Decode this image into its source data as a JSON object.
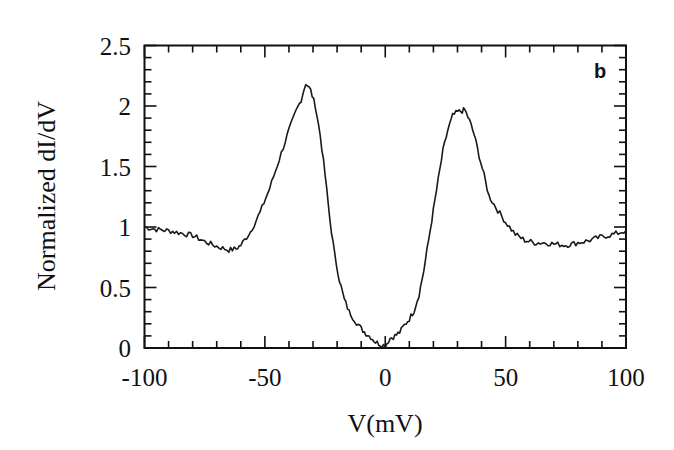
{
  "chart_data": {
    "type": "line",
    "title": "",
    "panel_label": "b",
    "xlabel": "V(mV)",
    "ylabel": "Normalized dI/dV",
    "xlim": [
      -100,
      100
    ],
    "ylim": [
      0,
      2.5
    ],
    "x_ticks": [
      -100,
      -50,
      0,
      50,
      100
    ],
    "x_tick_labels": [
      "-100",
      "-50",
      "0",
      "50",
      "100"
    ],
    "x_minor_step": 10,
    "y_ticks": [
      0,
      0.5,
      1,
      1.5,
      2,
      2.5
    ],
    "y_tick_labels": [
      "0",
      "0.5",
      "1",
      "1.5",
      "2",
      "2.5"
    ],
    "y_minor_step": 0.1,
    "grid": false,
    "legend": null,
    "line_color": "#1a1a1a",
    "series": [
      {
        "name": "dI/dV",
        "x": [
          -100,
          -95,
          -90,
          -85,
          -80,
          -75,
          -70,
          -65,
          -62,
          -60,
          -56,
          -52,
          -48,
          -44,
          -40,
          -37,
          -35,
          -33,
          -31,
          -29,
          -27,
          -25,
          -23,
          -21,
          -19,
          -17,
          -15,
          -12,
          -10,
          -8,
          -6,
          -4,
          -2,
          0,
          2,
          4,
          6,
          8,
          10,
          12,
          14,
          16,
          18,
          20,
          22,
          24,
          26,
          28,
          30,
          32,
          33,
          35,
          37,
          39,
          41,
          43,
          46,
          50,
          54,
          58,
          62,
          66,
          70,
          75,
          80,
          85,
          90,
          95,
          100
        ],
        "y": [
          1.0,
          0.98,
          0.97,
          0.95,
          0.93,
          0.88,
          0.84,
          0.81,
          0.82,
          0.85,
          0.96,
          1.12,
          1.32,
          1.56,
          1.8,
          1.96,
          2.05,
          2.19,
          2.13,
          2.0,
          1.76,
          1.43,
          1.06,
          0.77,
          0.56,
          0.4,
          0.3,
          0.21,
          0.16,
          0.12,
          0.09,
          0.05,
          0.03,
          0.02,
          0.08,
          0.1,
          0.13,
          0.19,
          0.24,
          0.31,
          0.44,
          0.64,
          0.89,
          1.14,
          1.39,
          1.63,
          1.8,
          1.92,
          1.95,
          1.96,
          1.97,
          1.88,
          1.76,
          1.59,
          1.43,
          1.26,
          1.16,
          1.04,
          0.94,
          0.89,
          0.87,
          0.87,
          0.86,
          0.85,
          0.87,
          0.89,
          0.92,
          0.94,
          0.97
        ]
      }
    ]
  }
}
